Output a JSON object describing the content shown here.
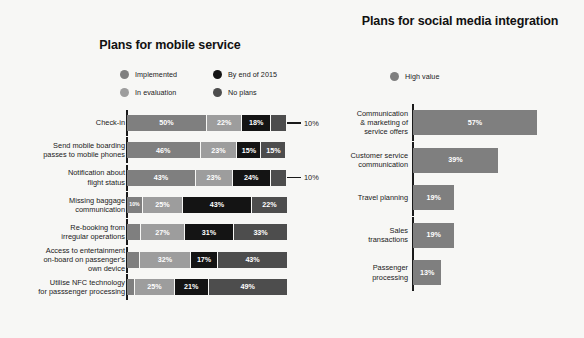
{
  "colors": {
    "background": "#f7f7f5",
    "implemented": "#7f7f7f",
    "in_evaluation": "#9d9d9d",
    "by_end_2015": "#141414",
    "no_plans": "#4d4d4d",
    "high_value": "#7f7f7f",
    "axis": "#1a1a1a",
    "text": "#1a1a1a",
    "bar_text": "#ffffff"
  },
  "left_panel": {
    "title": "Plans for mobile service",
    "legend": [
      {
        "label": "Implemented",
        "color": "#7f7f7f",
        "icon": "legend-dot-icon"
      },
      {
        "label": "By end of 2015",
        "color": "#141414",
        "icon": "legend-dot-icon"
      },
      {
        "label": "In evaluation",
        "color": "#9d9d9d",
        "icon": "legend-dot-icon"
      },
      {
        "label": "No plans",
        "color": "#4d4d4d",
        "icon": "legend-dot-icon"
      }
    ]
  },
  "right_panel": {
    "title": "Plans for social media integration",
    "legend": [
      {
        "label": "High value",
        "color": "#7f7f7f",
        "icon": "legend-dot-icon"
      }
    ]
  },
  "chart_data": [
    {
      "type": "bar",
      "orientation": "horizontal",
      "stacked": true,
      "normalized": true,
      "title": "Plans for mobile service",
      "xlabel": "",
      "ylabel": "",
      "xlim": [
        0,
        100
      ],
      "grid": false,
      "legend_position": "top",
      "units": "%",
      "categories": [
        "Check-in",
        "Send mobile boarding passes to mobile phones",
        "Notification about flight status",
        "Missing baggage communication",
        "Re-booking from irregular operations",
        "Access to entertainment on-board on passenger's own device",
        "Utilise NFC technology for passsenger processing"
      ],
      "series": [
        {
          "name": "Implemented",
          "color": "#7f7f7f",
          "values": [
            50,
            46,
            43,
            10,
            9,
            8,
            5
          ]
        },
        {
          "name": "In evaluation",
          "color": "#9d9d9d",
          "values": [
            22,
            23,
            23,
            25,
            27,
            32,
            25
          ]
        },
        {
          "name": "By end of 2015",
          "color": "#141414",
          "values": [
            18,
            15,
            24,
            43,
            31,
            17,
            21
          ]
        },
        {
          "name": "No plans",
          "color": "#4d4d4d",
          "values": [
            10,
            15,
            10,
            22,
            33,
            43,
            49
          ]
        }
      ],
      "annotations": [
        {
          "category": "Check-in",
          "series": "No plans",
          "text": "10%",
          "placement": "outside-right"
        },
        {
          "category": "Notification about flight status",
          "series": "No plans",
          "text": "10%",
          "placement": "outside-right"
        }
      ]
    },
    {
      "type": "bar",
      "orientation": "horizontal",
      "stacked": false,
      "title": "Plans for social media integration",
      "xlabel": "",
      "ylabel": "",
      "xlim": [
        0,
        100
      ],
      "grid": false,
      "legend_position": "top",
      "units": "%",
      "categories": [
        "Communication & marketing of service offers",
        "Customer service communication",
        "Travel planning",
        "Sales transactions",
        "Passenger processing"
      ],
      "series": [
        {
          "name": "High value",
          "color": "#7f7f7f",
          "values": [
            57,
            39,
            19,
            19,
            13
          ]
        }
      ]
    }
  ],
  "rows_left": [
    {
      "label_lines": [
        "Check-in"
      ],
      "segments": [
        {
          "value": 50,
          "text": "50%",
          "series": "Implemented",
          "color": "#7f7f7f",
          "show": true
        },
        {
          "value": 22,
          "text": "22%",
          "series": "In evaluation",
          "color": "#9d9d9d",
          "show": true
        },
        {
          "value": 18,
          "text": "18%",
          "series": "By end of 2015",
          "color": "#141414",
          "show": true
        },
        {
          "value": 10,
          "text": "10%",
          "series": "No plans",
          "color": "#4d4d4d",
          "show": false
        }
      ],
      "callout": "10%"
    },
    {
      "label_lines": [
        "Send mobile boarding",
        "passes to mobile phones"
      ],
      "segments": [
        {
          "value": 46,
          "text": "46%",
          "series": "Implemented",
          "color": "#7f7f7f",
          "show": true
        },
        {
          "value": 23,
          "text": "23%",
          "series": "In evaluation",
          "color": "#9d9d9d",
          "show": true
        },
        {
          "value": 15,
          "text": "15%",
          "series": "By end of 2015",
          "color": "#141414",
          "show": true
        },
        {
          "value": 15,
          "text": "15%",
          "series": "No plans",
          "color": "#4d4d4d",
          "show": true
        }
      ],
      "callout": null
    },
    {
      "label_lines": [
        "Notification about",
        "flight status"
      ],
      "segments": [
        {
          "value": 43,
          "text": "43%",
          "series": "Implemented",
          "color": "#7f7f7f",
          "show": true
        },
        {
          "value": 23,
          "text": "23%",
          "series": "In evaluation",
          "color": "#9d9d9d",
          "show": true
        },
        {
          "value": 24,
          "text": "24%",
          "series": "By end of 2015",
          "color": "#141414",
          "show": true
        },
        {
          "value": 10,
          "text": "10%",
          "series": "No plans",
          "color": "#4d4d4d",
          "show": false
        }
      ],
      "callout": "10%"
    },
    {
      "label_lines": [
        "Missing baggage",
        "communication"
      ],
      "segments": [
        {
          "value": 10,
          "text": "10%",
          "series": "Implemented",
          "color": "#7f7f7f",
          "show": true,
          "tiny": true
        },
        {
          "value": 25,
          "text": "25%",
          "series": "In evaluation",
          "color": "#9d9d9d",
          "show": true
        },
        {
          "value": 43,
          "text": "43%",
          "series": "By end of 2015",
          "color": "#141414",
          "show": true
        },
        {
          "value": 22,
          "text": "22%",
          "series": "No plans",
          "color": "#4d4d4d",
          "show": true
        }
      ],
      "callout": null
    },
    {
      "label_lines": [
        "Re-booking from",
        "irregular operations"
      ],
      "segments": [
        {
          "value": 9,
          "text": "",
          "series": "Implemented",
          "color": "#7f7f7f",
          "show": false
        },
        {
          "value": 27,
          "text": "27%",
          "series": "In evaluation",
          "color": "#9d9d9d",
          "show": true
        },
        {
          "value": 31,
          "text": "31%",
          "series": "By end of 2015",
          "color": "#141414",
          "show": true
        },
        {
          "value": 33,
          "text": "33%",
          "series": "No plans",
          "color": "#4d4d4d",
          "show": true
        }
      ],
      "callout": null
    },
    {
      "label_lines": [
        "Access to entertainment",
        "on-board on passenger's",
        "own device"
      ],
      "segments": [
        {
          "value": 8,
          "text": "",
          "series": "Implemented",
          "color": "#7f7f7f",
          "show": false
        },
        {
          "value": 32,
          "text": "32%",
          "series": "In evaluation",
          "color": "#9d9d9d",
          "show": true
        },
        {
          "value": 17,
          "text": "17%",
          "series": "By end of 2015",
          "color": "#141414",
          "show": true
        },
        {
          "value": 43,
          "text": "43%",
          "series": "No plans",
          "color": "#4d4d4d",
          "show": true
        }
      ],
      "callout": null
    },
    {
      "label_lines": [
        "Utilise NFC technology",
        "for passsenger processing"
      ],
      "segments": [
        {
          "value": 5,
          "text": "",
          "series": "Implemented",
          "color": "#7f7f7f",
          "show": false
        },
        {
          "value": 25,
          "text": "25%",
          "series": "In evaluation",
          "color": "#9d9d9d",
          "show": true
        },
        {
          "value": 21,
          "text": "21%",
          "series": "By end of 2015",
          "color": "#141414",
          "show": true
        },
        {
          "value": 49,
          "text": "49%",
          "series": "No plans",
          "color": "#4d4d4d",
          "show": true
        }
      ],
      "callout": null
    }
  ],
  "rows_right": [
    {
      "label_lines": [
        "Communication",
        "& marketing of",
        "service offers"
      ],
      "value": 57,
      "text": "57%",
      "color": "#7f7f7f"
    },
    {
      "label_lines": [
        "Customer service",
        "communication"
      ],
      "value": 39,
      "text": "39%",
      "color": "#7f7f7f"
    },
    {
      "label_lines": [
        "Travel planning"
      ],
      "value": 19,
      "text": "19%",
      "color": "#7f7f7f"
    },
    {
      "label_lines": [
        "Sales",
        "transactions"
      ],
      "value": 19,
      "text": "19%",
      "color": "#7f7f7f"
    },
    {
      "label_lines": [
        "Passenger",
        "processing"
      ],
      "value": 13,
      "text": "13%",
      "color": "#7f7f7f"
    }
  ]
}
